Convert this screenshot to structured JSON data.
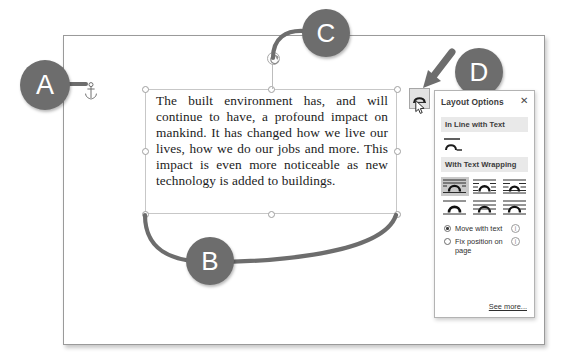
{
  "document": {
    "body_text": "The built environment has, and will continue to have, a profound impact on mankind. It has changed how we live our lives, how we do our jobs and more. This impact is even more noticeable as new technology is added to buildings."
  },
  "callouts": [
    {
      "id": "A",
      "label": "A",
      "points_to": "anchor-icon"
    },
    {
      "id": "B",
      "label": "B",
      "points_to": "bottom-sizing-handles"
    },
    {
      "id": "C",
      "label": "C",
      "points_to": "rotation-handle"
    },
    {
      "id": "D",
      "label": "D",
      "points_to": "layout-options-button"
    }
  ],
  "icons": {
    "anchor": "anchor-icon",
    "rotate": "rotate-handle-icon",
    "cursor": "mouse-pointer-icon",
    "close": "close-icon"
  },
  "layout_options": {
    "title": "Layout Options",
    "close_label": "✕",
    "sections": [
      {
        "heading": "In Line with Text"
      },
      {
        "heading": "With Text Wrapping"
      }
    ],
    "inline_option": {
      "name": "in-line-with-text",
      "selected": false
    },
    "wrapping_options": [
      {
        "name": "square",
        "selected": true
      },
      {
        "name": "tight",
        "selected": false
      },
      {
        "name": "through",
        "selected": false
      },
      {
        "name": "top-and-bottom",
        "selected": false
      },
      {
        "name": "behind-text",
        "selected": false
      },
      {
        "name": "in-front-of-text",
        "selected": false
      }
    ],
    "position_options": [
      {
        "label": "Move with text",
        "selected": true,
        "info": "ⓘ"
      },
      {
        "label": "Fix position on page",
        "selected": false,
        "info": "ⓘ"
      }
    ],
    "see_more_label": "See more..."
  },
  "colors": {
    "badge_fill": "#6d6d6d",
    "badge_text": "#ffffff",
    "panel_border": "#b3b3b3",
    "section_head_bg": "#e9e9e9",
    "selected_cell_bg": "#c9c9c9",
    "page_border": "#9a9a9a",
    "handle_stroke": "#9f9f9f"
  }
}
